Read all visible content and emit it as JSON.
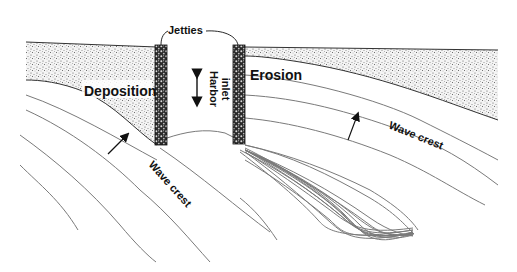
{
  "figure": {
    "labels": {
      "jetties": "Jetties",
      "harbor_inlet_line1": "Harbor",
      "harbor_inlet_line2": "inlet",
      "deposition": "Deposition",
      "erosion": "Erosion",
      "wave_crest_left": "Wave crest",
      "wave_crest_right": "Wave crest"
    },
    "colors": {
      "sand": "#cfcfcf",
      "jetty": "#2a2a2a",
      "wave_line": "#7a7a7a",
      "text": "#111111",
      "background": "#ffffff"
    }
  }
}
